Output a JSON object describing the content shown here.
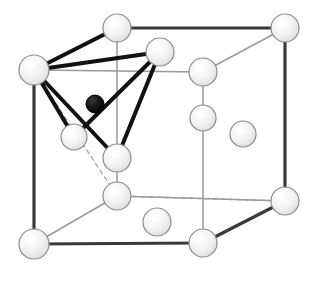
{
  "figure": {
    "type": "crystal-structure-diagram",
    "canvas": {
      "width": 321,
      "height": 286,
      "background": "#ffffff"
    },
    "colors": {
      "sphere_fill": "#f2f2f2",
      "sphere_highlight": "#ffffff",
      "sphere_stroke": "#8c8c8c",
      "interstitial_fill": "#111111",
      "interstitial_stroke": "#000000",
      "cell_edge_front": "#3a3a3a",
      "cell_edge_back": "#9a9a9a",
      "hidden_edge_dashed": "#b4a0a0",
      "bond": "#111111"
    },
    "legend": {
      "host_atom_label": "host atom (face-centred cubic lattice)",
      "interstitial_atom_label": "interstitial atom",
      "bond_label": "bond to nearest-neighbour host atoms",
      "dashed_label": "hidden cell edge"
    },
    "counts": {
      "host_atoms_drawn": 14,
      "interstitial_atoms_drawn": 1,
      "bonds_drawn": 6,
      "corner_atoms": 8,
      "face_centre_atoms": 6
    }
  },
  "geometry": {
    "cube_front_face": [
      {
        "name": "front-top-left",
        "x": 34,
        "y": 70
      },
      {
        "name": "front-top-right",
        "x": 203,
        "y": 72
      },
      {
        "name": "front-bottom-right",
        "x": 203,
        "y": 243
      },
      {
        "name": "front-bottom-left",
        "x": 34,
        "y": 244
      }
    ],
    "cube_back_face": [
      {
        "name": "back-top-left",
        "x": 117,
        "y": 28
      },
      {
        "name": "back-top-right",
        "x": 285,
        "y": 28
      },
      {
        "name": "back-bottom-right",
        "x": 285,
        "y": 201
      },
      {
        "name": "back-bottom-left",
        "x": 117,
        "y": 196
      }
    ],
    "atoms": [
      {
        "id": "corner-front-top-left",
        "role": "corner",
        "x": 34,
        "y": 70,
        "r": 15,
        "fill": "light"
      },
      {
        "id": "corner-front-top-right",
        "role": "corner",
        "x": 203,
        "y": 72,
        "r": 14,
        "fill": "light"
      },
      {
        "id": "corner-front-bottom-left",
        "role": "corner",
        "x": 34,
        "y": 244,
        "r": 15,
        "fill": "light"
      },
      {
        "id": "corner-front-bottom-right",
        "role": "corner",
        "x": 203,
        "y": 243,
        "r": 14,
        "fill": "light"
      },
      {
        "id": "corner-back-top-left",
        "role": "corner",
        "x": 117,
        "y": 28,
        "r": 14,
        "fill": "light"
      },
      {
        "id": "corner-back-top-right",
        "role": "corner",
        "x": 285,
        "y": 28,
        "r": 14,
        "fill": "light"
      },
      {
        "id": "corner-back-bottom-left",
        "role": "corner",
        "x": 117,
        "y": 196,
        "r": 14,
        "fill": "light"
      },
      {
        "id": "corner-back-bottom-right",
        "role": "corner",
        "x": 285,
        "y": 201,
        "r": 14,
        "fill": "light"
      },
      {
        "id": "face-top",
        "role": "face-centre",
        "x": 160,
        "y": 52,
        "r": 14,
        "fill": "light"
      },
      {
        "id": "face-left",
        "role": "face-centre",
        "x": 74,
        "y": 137,
        "r": 13,
        "fill": "light"
      },
      {
        "id": "face-front",
        "role": "face-centre",
        "x": 117,
        "y": 158,
        "r": 14,
        "fill": "light"
      },
      {
        "id": "face-back",
        "role": "face-centre",
        "x": 203,
        "y": 118,
        "r": 13,
        "fill": "light"
      },
      {
        "id": "face-right",
        "role": "face-centre",
        "x": 243,
        "y": 134,
        "r": 13,
        "fill": "light"
      },
      {
        "id": "face-bottom",
        "role": "face-centre",
        "x": 157,
        "y": 222,
        "r": 14,
        "fill": "light"
      },
      {
        "id": "interstitial",
        "role": "interstitial",
        "x": 95,
        "y": 104,
        "r": 9,
        "fill": "dark"
      }
    ],
    "bonds": [
      {
        "from": "corner-front-top-left",
        "to": "corner-back-top-left",
        "width": 4
      },
      {
        "from": "corner-front-top-left",
        "to": "face-top",
        "width": 4
      },
      {
        "from": "corner-front-top-left",
        "to": "face-left",
        "width": 4
      },
      {
        "from": "corner-front-top-left",
        "to": "face-front",
        "width": 4
      },
      {
        "from": "face-top",
        "to": "face-left",
        "width": 4
      },
      {
        "from": "face-top",
        "to": "face-front",
        "width": 4
      }
    ],
    "solid_edges": [
      {
        "from": "front-top-left",
        "to": "front-top-right",
        "weight": "thin"
      },
      {
        "from": "front-top-left",
        "to": "front-bottom-left",
        "weight": "thick"
      },
      {
        "from": "front-bottom-left",
        "to": "front-bottom-right",
        "weight": "thick"
      },
      {
        "from": "front-top-right",
        "to": "front-bottom-right",
        "weight": "thin"
      },
      {
        "from": "back-top-left",
        "to": "back-top-right",
        "weight": "thick"
      },
      {
        "from": "back-top-right",
        "to": "back-bottom-right",
        "weight": "thick"
      },
      {
        "from": "back-bottom-right",
        "to": "back-bottom-left",
        "weight": "thin"
      },
      {
        "from": "front-top-right",
        "to": "back-top-right",
        "weight": "thin"
      },
      {
        "from": "front-bottom-right",
        "to": "back-bottom-right",
        "weight": "thick"
      },
      {
        "from": "front-bottom-left",
        "to": "back-bottom-left",
        "weight": "thin"
      },
      {
        "from": "back-top-left",
        "to": "back-bottom-left",
        "weight": "thin"
      }
    ],
    "dashed_edges": [
      {
        "from": "front-top-left",
        "to": "back-top-left"
      },
      {
        "from": "front-top-left",
        "to": "back-bottom-left"
      },
      {
        "from": "back-bottom-left",
        "to": "back-bottom-right"
      }
    ]
  }
}
